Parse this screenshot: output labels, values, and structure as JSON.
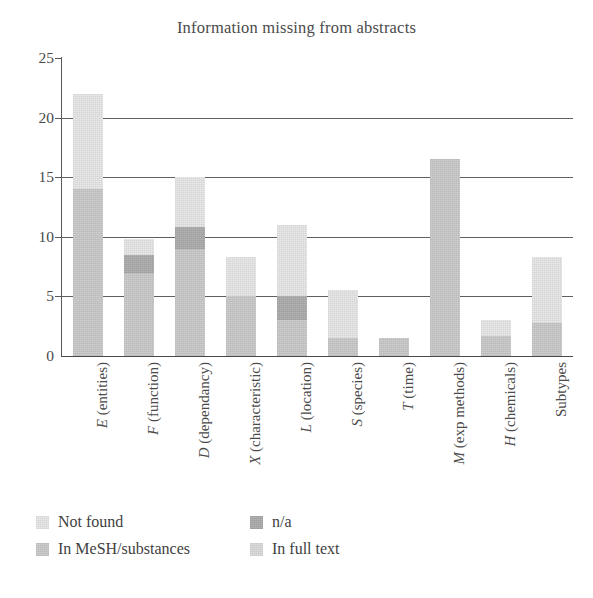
{
  "figure": {
    "title": "Information missing from abstracts"
  },
  "legend": {
    "items": [
      {
        "label": "Not found",
        "key": "not_found",
        "color": "#eaeaea",
        "slot": "lg-c0",
        "fill": "fill-notfound"
      },
      {
        "label": "In MeSH/substances",
        "key": "in_mesh",
        "color": "#cfcfcf",
        "slot": "lg-c1",
        "fill": "fill-mesh"
      },
      {
        "label": "n/a",
        "key": "na",
        "color": "#b3b3b3",
        "slot": "lg-c2",
        "fill": "fill-na"
      },
      {
        "label": "In full text",
        "key": "in_full_text",
        "color": "#dcdcdc",
        "slot": "lg-c3",
        "fill": "fill-fulltext"
      }
    ]
  },
  "axes": {
    "y_ticks": [
      0,
      5,
      10,
      15,
      20,
      25
    ],
    "y_tick_labels": [
      "0",
      "5",
      "10",
      "15",
      "20",
      "25"
    ],
    "ylim": [
      0,
      25
    ],
    "grid": true
  },
  "chart_data": {
    "type": "bar",
    "stacked": true,
    "title": "Information missing from abstracts",
    "xlabel": "",
    "ylabel": "",
    "ylim": [
      0,
      25
    ],
    "grid": true,
    "legend_position": "below-axes",
    "categories": [
      "E (entities)",
      "F (function)",
      "D (dependancy)",
      "X (characteristic)",
      "L (location)",
      "S (species)",
      "T (time)",
      "M (exp methods)",
      "H (chemicals)",
      "Subtypes"
    ],
    "category_parts": [
      {
        "symbol": "E",
        "name": "(entities)"
      },
      {
        "symbol": "F",
        "name": "(function)"
      },
      {
        "symbol": "D",
        "name": "(dependancy)"
      },
      {
        "symbol": "X",
        "name": "(characteristic)"
      },
      {
        "symbol": "L",
        "name": "(location)"
      },
      {
        "symbol": "S",
        "name": "(species)"
      },
      {
        "symbol": "T",
        "name": "(time)"
      },
      {
        "symbol": "M",
        "name": "(exp methods)"
      },
      {
        "symbol": "H",
        "name": "(chemicals)"
      },
      {
        "symbol": "",
        "name": "Subtypes"
      }
    ],
    "series": [
      {
        "name": "In MeSH/substances",
        "key": "in_mesh",
        "color": "#cfcfcf",
        "values": [
          14.0,
          7.0,
          9.0,
          5.0,
          3.0,
          1.5,
          1.5,
          16.5,
          1.7,
          2.8
        ]
      },
      {
        "name": "n/a",
        "key": "na",
        "color": "#b3b3b3",
        "values": [
          0.0,
          1.5,
          1.8,
          0.0,
          2.0,
          0.0,
          0.0,
          0.0,
          0.0,
          0.0
        ]
      },
      {
        "name": "Not found",
        "key": "not_found",
        "color": "#eaeaea",
        "values": [
          8.0,
          1.3,
          4.2,
          3.3,
          6.0,
          4.0,
          0.0,
          0.0,
          1.3,
          5.5
        ]
      },
      {
        "name": "In full text",
        "key": "in_full_text",
        "color": "#dcdcdc",
        "values": [
          0.0,
          0.0,
          0.0,
          0.0,
          0.0,
          0.0,
          0.0,
          0.0,
          0.0,
          0.0
        ]
      }
    ],
    "totals": [
      22.0,
      9.8,
      15.0,
      8.3,
      11.0,
      5.5,
      1.5,
      16.5,
      3.0,
      8.3
    ]
  }
}
